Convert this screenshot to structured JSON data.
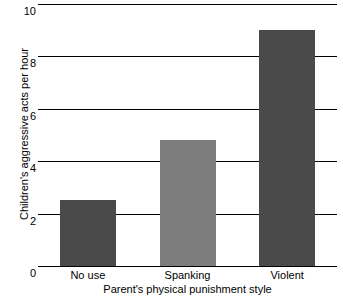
{
  "chart_data": {
    "type": "bar",
    "title": "",
    "xlabel": "Parent's physical punishment style",
    "ylabel": "Children's aggressive acts per hour",
    "categories": [
      "No use",
      "Spanking",
      "Violent"
    ],
    "values": [
      2.5,
      4.8,
      9.0
    ],
    "ylim": [
      0,
      10
    ],
    "yticks": [
      0,
      2,
      4,
      6,
      8,
      10
    ],
    "ytick_labels": [
      "0",
      "2",
      "4",
      "6",
      "8",
      "10"
    ],
    "grid": true,
    "legend": "none",
    "bar_colors": [
      "#4a4a4a",
      "#7d7d7d",
      "#4a4a4a"
    ],
    "gridline_color": "#000000",
    "background_color": "#ffffff"
  }
}
